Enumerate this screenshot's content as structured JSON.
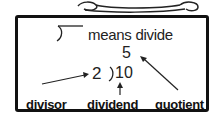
{
  "diagram": {
    "definition": {
      "symbol": "long-division-bracket",
      "text": "means divide"
    },
    "example": {
      "quotient": "5",
      "divisor": "2",
      "dividend": "10"
    },
    "labels": {
      "divisor": "divisor",
      "dividend": "dividend",
      "quotient": "quotient"
    }
  },
  "colors": {
    "stroke": "#111111",
    "background": "#ffffff"
  }
}
